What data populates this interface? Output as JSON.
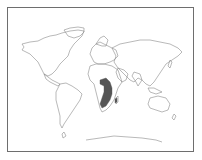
{
  "map": {
    "type": "world-outline-map",
    "projection": "equirectangular-like",
    "highlighted_region": {
      "name": "southern-and-eastern-africa-range",
      "color": "#555555"
    },
    "outline_color": "#8a8a8a",
    "frame_color": "#6e6e6e",
    "labels": []
  }
}
